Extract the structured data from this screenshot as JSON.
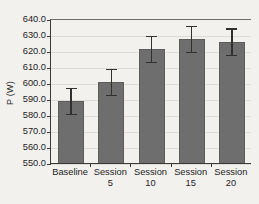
{
  "chart_data": {
    "type": "bar",
    "title": "",
    "xlabel": "",
    "ylabel": "P (W)",
    "categories": [
      "Baseline",
      "Session 5",
      "Session 10",
      "Session 15",
      "Session 20"
    ],
    "category_lines": [
      [
        "Baseline"
      ],
      [
        "Session",
        "5"
      ],
      [
        "Session",
        "10"
      ],
      [
        "Session",
        "15"
      ],
      [
        "Session",
        "20"
      ]
    ],
    "values": [
      589.5,
      601.3,
      622.0,
      628.2,
      626.4
    ],
    "errors": [
      8.0,
      8.0,
      8.0,
      8.2,
      8.4
    ],
    "error_type": "symmetric",
    "ylim": [
      550.0,
      640.0
    ],
    "yticks": [
      640.0,
      630.0,
      620.0,
      610.0,
      600.0,
      590.0,
      580.0,
      570.0,
      560.0,
      550.0
    ],
    "ytick_labels": [
      "640.0",
      "630.0",
      "620.0",
      "610.0",
      "600.0",
      "590.0",
      "580.0",
      "570.0",
      "560.0",
      "550.0"
    ],
    "grid": true,
    "grid_axis": "y",
    "legend": false,
    "legend_position": "none",
    "bar_color": "#6e6e6e",
    "error_color": "#303030",
    "grid_color": "#dedad5",
    "axis_color": "#3a3a3a",
    "background_color": "#f3f1ee"
  }
}
